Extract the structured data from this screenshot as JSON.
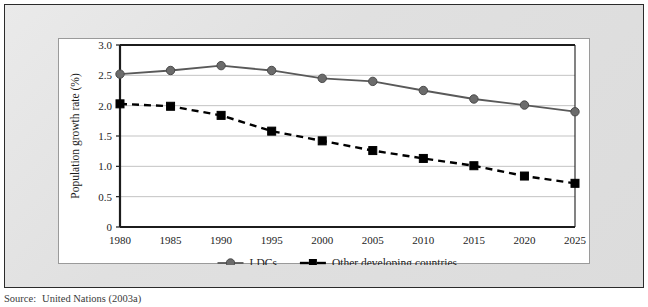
{
  "figure": {
    "source_label": "Source:",
    "source_text": "United Nations (2003a)"
  },
  "colors": {
    "ldcs_line": "#595959",
    "ldcs_marker": "#6b6b6b",
    "other_line": "#000000",
    "other_marker": "#000000",
    "gridline": "#c3c3c3",
    "axis": "#1c1c1c",
    "panel_background": "#ffffff",
    "mat_background": "#e2e2e2",
    "frame_border": "#2b2b2b"
  },
  "chart_data": {
    "type": "line",
    "title": "",
    "xlabel": "",
    "ylabel": "Population growth rate (%)",
    "categories": [
      1980,
      1985,
      1990,
      1995,
      2000,
      2005,
      2010,
      2015,
      2020,
      2025
    ],
    "xtick_labels": [
      "1980",
      "1985",
      "1990",
      "1995",
      "2000",
      "2005",
      "2010",
      "2015",
      "2020",
      "2025"
    ],
    "ytick_labels": [
      "0",
      "0.5",
      "1.0",
      "1.5",
      "2.0",
      "2.5",
      "3.0"
    ],
    "yticks": [
      0,
      0.5,
      1.0,
      1.5,
      2.0,
      2.5,
      3.0
    ],
    "ylim": [
      0,
      3.0
    ],
    "xlim": [
      1980,
      2025
    ],
    "grid": "horizontal",
    "legend_position": "bottom",
    "series": [
      {
        "name": "LDCs",
        "marker": "circle",
        "linestyle": "solid",
        "color": "#595959",
        "values": [
          2.52,
          2.58,
          2.66,
          2.58,
          2.45,
          2.4,
          2.25,
          2.11,
          2.01,
          1.9
        ]
      },
      {
        "name": "Other developing countries",
        "marker": "square",
        "linestyle": "dashed",
        "color": "#000000",
        "values": [
          2.03,
          1.99,
          1.84,
          1.58,
          1.42,
          1.26,
          1.13,
          1.01,
          0.84,
          0.72
        ]
      }
    ]
  }
}
